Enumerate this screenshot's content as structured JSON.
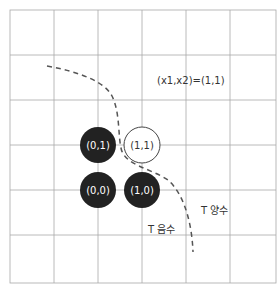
{
  "diagram": {
    "title_label": "(x1,x2)=(1,1)",
    "region_positive": "T 양수",
    "region_negative": "T 음수",
    "nodes": [
      {
        "label": "(0,1)",
        "filled": true
      },
      {
        "label": "(1,1)",
        "filled": false
      },
      {
        "label": "(0,0)",
        "filled": true
      },
      {
        "label": "(1,0)",
        "filled": true
      }
    ],
    "colors": {
      "grid": "#9a9a9a",
      "filled_node": "#222222",
      "node_text_on_dark": "#ffffff",
      "node_text_on_light": "#333333",
      "boundary": "#555555"
    }
  }
}
